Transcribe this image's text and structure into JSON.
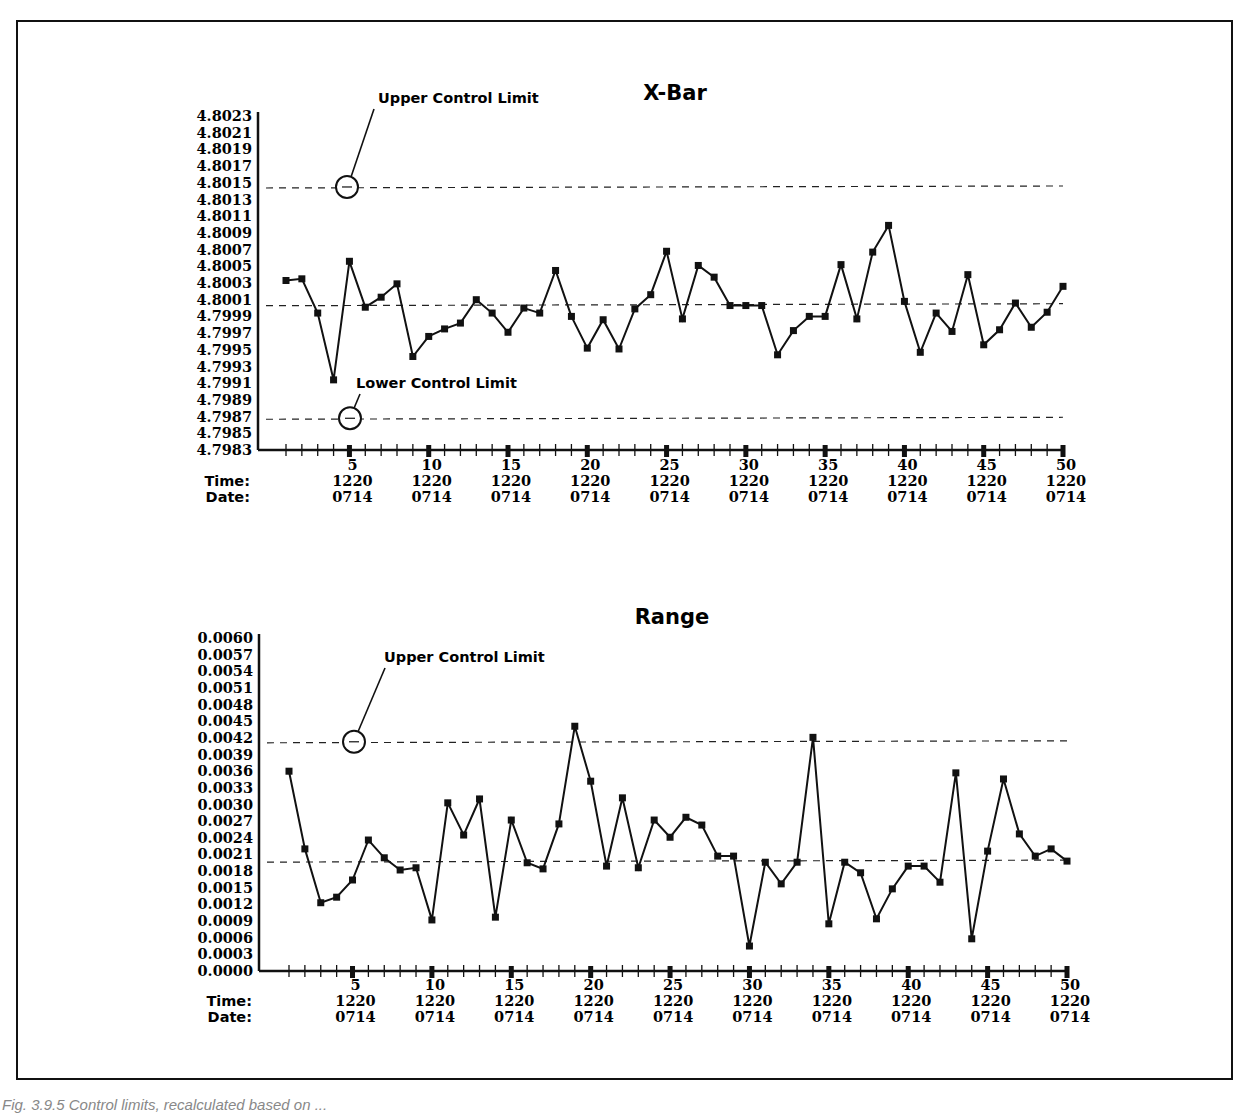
{
  "figure": {
    "caption": "Fig. 3.9.5   Control limits, recalculated based on ..."
  },
  "chart_data": [
    {
      "type": "line",
      "title": "X-Bar",
      "xlabel": "Sample",
      "ylabel": "",
      "x_tick_labels": [
        "5",
        "10",
        "15",
        "20",
        "25",
        "30",
        "35",
        "40",
        "45",
        "50"
      ],
      "x_row_labels": {
        "time_label": "Time:",
        "date_label": "Date:",
        "time": "1220",
        "date": "0714"
      },
      "y_ticks": [
        "4.8023",
        "4.8021",
        "4.8019",
        "4.8017",
        "4.8015",
        "4.8013",
        "4.8011",
        "4.8009",
        "4.8007",
        "4.8005",
        "4.8003",
        "4.8001",
        "4.7999",
        "4.7997",
        "4.7995",
        "4.7993",
        "4.7991",
        "4.7989",
        "4.7987",
        "4.7985",
        "4.7983"
      ],
      "ylim": [
        4.7983,
        4.8023
      ],
      "upper_control_limit": 4.80145,
      "center_line": 4.80004,
      "lower_control_limit": 4.79868,
      "annotations": [
        "Upper Control Limit",
        "Lower Control Limit"
      ],
      "x": [
        1,
        2,
        3,
        4,
        5,
        6,
        7,
        8,
        9,
        10,
        11,
        12,
        13,
        14,
        15,
        16,
        17,
        18,
        19,
        20,
        21,
        22,
        23,
        24,
        25,
        26,
        27,
        28,
        29,
        30,
        31,
        32,
        33,
        34,
        35,
        36,
        37,
        38,
        39,
        40,
        41,
        42,
        43,
        44,
        45,
        46,
        47,
        48,
        49,
        50
      ],
      "values": [
        4.80033,
        4.80035,
        4.79994,
        4.79914,
        4.80056,
        4.80001,
        4.80013,
        4.80029,
        4.79942,
        4.79966,
        4.79975,
        4.79982,
        4.8001,
        4.79994,
        4.79971,
        4.8,
        4.79994,
        4.80045,
        4.7999,
        4.79952,
        4.79986,
        4.79951,
        4.79999,
        4.80016,
        4.80068,
        4.79987,
        4.80051,
        4.80037,
        4.80003,
        4.80003,
        4.80003,
        4.79944,
        4.79973,
        4.7999,
        4.7999,
        4.80052,
        4.79987,
        4.80067,
        4.80099,
        4.80008,
        4.79947,
        4.79994,
        4.79972,
        4.8004,
        4.79956,
        4.79974,
        4.80006,
        4.79977,
        4.79995,
        4.80026
      ],
      "grid": false,
      "legend": "none"
    },
    {
      "type": "line",
      "title": "Range",
      "xlabel": "Sample",
      "ylabel": "",
      "x_tick_labels": [
        "5",
        "10",
        "15",
        "20",
        "25",
        "30",
        "35",
        "40",
        "45",
        "50"
      ],
      "x_row_labels": {
        "time_label": "Time:",
        "date_label": "Date:",
        "time": "1220",
        "date": "0714"
      },
      "y_ticks": [
        "0.0060",
        "0.0057",
        "0.0054",
        "0.0051",
        "0.0048",
        "0.0045",
        "0.0042",
        "0.0039",
        "0.0036",
        "0.0033",
        "0.0030",
        "0.0027",
        "0.0024",
        "0.0021",
        "0.0018",
        "0.0015",
        "0.0012",
        "0.0009",
        "0.0006",
        "0.0003",
        "0.0000"
      ],
      "ylim": [
        0.0,
        0.006
      ],
      "upper_control_limit": 0.00413,
      "center_line": 0.00198,
      "annotations": [
        "Upper Control Limit"
      ],
      "x": [
        1,
        2,
        3,
        4,
        5,
        6,
        7,
        8,
        9,
        10,
        11,
        12,
        13,
        14,
        15,
        16,
        17,
        18,
        19,
        20,
        21,
        22,
        23,
        24,
        25,
        26,
        27,
        28,
        29,
        30,
        31,
        32,
        33,
        34,
        35,
        36,
        37,
        38,
        39,
        40,
        41,
        42,
        43,
        44,
        45,
        46,
        47,
        48,
        49,
        50
      ],
      "values": [
        0.0036,
        0.0022,
        0.00123,
        0.00133,
        0.00164,
        0.00236,
        0.00204,
        0.00182,
        0.00186,
        0.00092,
        0.00303,
        0.00245,
        0.0031,
        0.00097,
        0.00272,
        0.00195,
        0.00184,
        0.00265,
        0.00441,
        0.00342,
        0.00189,
        0.00312,
        0.00186,
        0.00272,
        0.00241,
        0.00277,
        0.00263,
        0.00207,
        0.00207,
        0.00045,
        0.00196,
        0.00157,
        0.00196,
        0.00421,
        0.00085,
        0.00196,
        0.00177,
        0.00094,
        0.00148,
        0.00189,
        0.00189,
        0.0016,
        0.00357,
        0.00058,
        0.00216,
        0.00346,
        0.00247,
        0.00207,
        0.0022,
        0.00198
      ],
      "grid": false,
      "legend": "none"
    }
  ]
}
